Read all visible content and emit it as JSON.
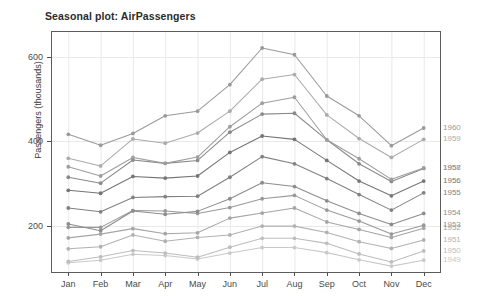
{
  "chart_data": {
    "type": "line",
    "title": "Seasonal plot: AirPassengers",
    "xlabel": "",
    "ylabel": "Passengers (thousands)",
    "categories": [
      "Jan",
      "Feb",
      "Mar",
      "Apr",
      "May",
      "Jun",
      "Jul",
      "Aug",
      "Sep",
      "Oct",
      "Nov",
      "Dec"
    ],
    "ylim": [
      90,
      660
    ],
    "yticks": [
      200,
      400,
      600
    ],
    "ytick_labels": [
      "200",
      "400",
      "600"
    ],
    "grid": true,
    "legend_position": "right-edge-series-labels",
    "series": [
      {
        "name": "1949",
        "label": "1949",
        "color": "#c9c9c9",
        "values": [
          112,
          118,
          132,
          129,
          121,
          135,
          148,
          148,
          136,
          119,
          104,
          118
        ]
      },
      {
        "name": "1950",
        "label": "1950",
        "color": "#bdbdbd",
        "values": [
          115,
          126,
          141,
          135,
          125,
          149,
          170,
          170,
          158,
          133,
          114,
          140
        ]
      },
      {
        "name": "1951",
        "label": "1951",
        "color": "#b1b1b1",
        "values": [
          145,
          150,
          178,
          163,
          172,
          178,
          199,
          199,
          184,
          162,
          146,
          166
        ]
      },
      {
        "name": "1952",
        "label": "1952",
        "color": "#a5a5a5",
        "values": [
          171,
          180,
          193,
          181,
          183,
          218,
          230,
          242,
          209,
          191,
          172,
          194
        ]
      },
      {
        "name": "1953",
        "label": "1953",
        "color": "#999999",
        "values": [
          196,
          196,
          236,
          235,
          229,
          243,
          264,
          272,
          237,
          211,
          180,
          201
        ]
      },
      {
        "name": "1954",
        "label": "1954",
        "color": "#8d8d8d",
        "values": [
          204,
          188,
          235,
          227,
          234,
          264,
          302,
          293,
          259,
          229,
          203,
          229
        ]
      },
      {
        "name": "1955",
        "label": "1955",
        "color": "#818181",
        "values": [
          242,
          233,
          267,
          269,
          270,
          315,
          364,
          347,
          312,
          274,
          237,
          278
        ]
      },
      {
        "name": "1956",
        "label": "1956",
        "color": "#757575",
        "values": [
          284,
          277,
          317,
          313,
          318,
          374,
          413,
          405,
          355,
          306,
          271,
          306
        ]
      },
      {
        "name": "1957",
        "label": "1957",
        "color": "#8a8a8a",
        "values": [
          315,
          301,
          356,
          348,
          355,
          422,
          465,
          467,
          404,
          347,
          305,
          336
        ]
      },
      {
        "name": "1958",
        "label": "1958",
        "color": "#9e9e9e",
        "values": [
          340,
          318,
          362,
          348,
          363,
          435,
          491,
          505,
          404,
          359,
          310,
          337
        ]
      },
      {
        "name": "1959",
        "label": "1959",
        "color": "#ababab",
        "values": [
          360,
          342,
          406,
          396,
          420,
          472,
          548,
          559,
          463,
          407,
          362,
          405
        ]
      },
      {
        "name": "1960",
        "label": "1960",
        "color": "#9a9a9a",
        "values": [
          417,
          391,
          419,
          461,
          472,
          535,
          622,
          606,
          508,
          461,
          390,
          432
        ]
      }
    ]
  },
  "axis": {
    "y_title": "Passengers (thousands)"
  }
}
